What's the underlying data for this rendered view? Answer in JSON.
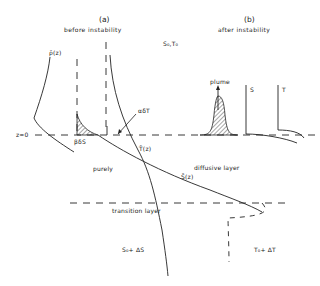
{
  "panels": {
    "a": {
      "label": "(a)",
      "caption": "before instability"
    },
    "b": {
      "label": "(b)",
      "caption": "after instability"
    }
  },
  "labels": {
    "rho_z": "ρ̄(z)",
    "s0t0": "S₀,T₀",
    "alpha_dT": "αδT",
    "beta_dS": "βδS",
    "z0": "z=0",
    "T_z": "T̄(z)",
    "S_z": "S̄(z)",
    "purely": "purely",
    "diffusive_layer": "diffusive layer",
    "transition_layer": "transition layer",
    "s0_dS": "S₀+ ΔS",
    "t0_dT": "T₀+ ΔT",
    "plume": "plume",
    "S": "S",
    "T": "T"
  },
  "colors": {
    "ink": "#222222",
    "background": "#ffffff"
  }
}
